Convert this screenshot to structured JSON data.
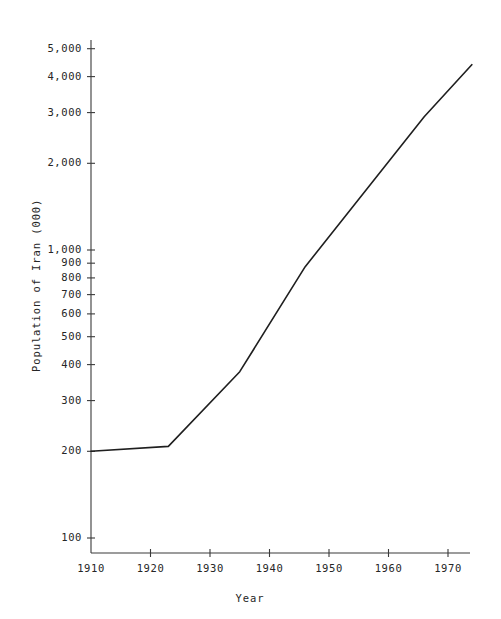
{
  "chart_data": {
    "type": "line",
    "title": "",
    "xlabel": "Year",
    "ylabel": "Population of Iran (000)",
    "yscale": "log",
    "xscale": "linear",
    "grid": false,
    "legend": null,
    "xlim": [
      1908,
      1975
    ],
    "ylim": [
      90,
      5600
    ],
    "x_tick_labels": [
      "1910",
      "1920",
      "1930",
      "1940",
      "1950",
      "1960",
      "1970"
    ],
    "x_ticks": [
      1910,
      1920,
      1930,
      1940,
      1950,
      1960,
      1970
    ],
    "y_tick_labels": [
      "100",
      "200",
      "300",
      "400",
      "500",
      "600",
      "700",
      "800",
      "900",
      "1,000",
      "2,000",
      "3,000",
      "4,000",
      "5,000"
    ],
    "y_ticks": [
      100,
      200,
      300,
      400,
      500,
      600,
      700,
      800,
      900,
      1000,
      2000,
      3000,
      4000,
      5000
    ],
    "series": [
      {
        "name": "Population of Iran",
        "x": [
          1910,
          1923,
          1935,
          1946,
          1966,
          1974
        ],
        "values": [
          200,
          208,
          378,
          875,
          2900,
          4400
        ]
      }
    ]
  },
  "axis": {
    "x_title": "Year",
    "y_title": "Population of Iran (000)"
  }
}
